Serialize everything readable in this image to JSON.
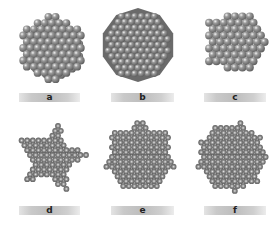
{
  "figure": {
    "panels": [
      {
        "id": "a",
        "label": "a",
        "shape": "3D cluster, cuboctahedral/hexagonal outline"
      },
      {
        "id": "b",
        "label": "b",
        "shape": "decagonal faceted cluster"
      },
      {
        "id": "c",
        "label": "c",
        "shape": "pentagonal-outline cluster"
      },
      {
        "id": "d",
        "label": "d",
        "shape": "five-pointed star monolayer"
      },
      {
        "id": "e",
        "label": "e",
        "shape": "rough circular disc"
      },
      {
        "id": "f",
        "label": "f",
        "shape": "rough circular disc"
      }
    ]
  },
  "colors": {
    "background": "#ffffff",
    "sphere_dark": "#5e5e5e",
    "sphere_mid": "#9a9a9a",
    "sphere_highlight": "#f2f2f2",
    "label_bar": "#c4c4c4"
  }
}
